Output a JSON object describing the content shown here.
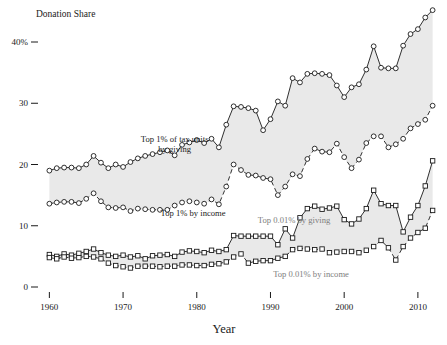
{
  "chart_data": {
    "type": "line",
    "title": "",
    "ylabel": "Donation Share",
    "xlabel": "Year",
    "ylim": [
      0,
      46
    ],
    "xlim": [
      1959,
      2013
    ],
    "ytick_labels": [
      "40%",
      "30",
      "20",
      "10",
      "0"
    ],
    "ytick_values": [
      40,
      30,
      20,
      10,
      0
    ],
    "xtick_labels": [
      "1960",
      "1970",
      "1980",
      "1990",
      "2000",
      "2010"
    ],
    "xtick_values": [
      1960,
      1970,
      1980,
      1990,
      2000,
      2010
    ],
    "grid": false,
    "legend_position": "inline-annotations",
    "annotations": [
      {
        "name": "top1-giving-label",
        "text_line1": "Top 1% of tax units",
        "text_line2": "by giving",
        "x": 1977.0,
        "y": 23.6,
        "faded": false
      },
      {
        "name": "top1-income-label",
        "text": "Top 1% by income",
        "x": 1979.5,
        "y": 11.6,
        "faded": false
      },
      {
        "name": "top001-giving-label",
        "text": "Top 0.01% by giving",
        "x": 1993.2,
        "y": 10.4,
        "faded": true
      },
      {
        "name": "top001-income-label",
        "text": "Top 0.01% by income",
        "x": 1995.5,
        "y": 1.6,
        "faded": true
      }
    ],
    "x": [
      1960,
      1961,
      1962,
      1963,
      1964,
      1965,
      1966,
      1967,
      1968,
      1969,
      1970,
      1971,
      1972,
      1973,
      1974,
      1975,
      1976,
      1977,
      1978,
      1979,
      1980,
      1981,
      1982,
      1983,
      1984,
      1985,
      1986,
      1987,
      1988,
      1989,
      1990,
      1991,
      1992,
      1993,
      1994,
      1995,
      1996,
      1997,
      1998,
      1999,
      2000,
      2001,
      2002,
      2003,
      2004,
      2005,
      2006,
      2007,
      2008,
      2009,
      2010,
      2011,
      2012
    ],
    "series": [
      {
        "name": "Top 1% of tax units by giving",
        "marker": "circle",
        "style": "solid",
        "values": [
          19.0,
          19.4,
          19.5,
          19.5,
          19.4,
          20.0,
          21.4,
          20.3,
          19.4,
          20.0,
          19.6,
          20.4,
          21.0,
          21.4,
          21.7,
          22.0,
          22.3,
          21.5,
          23.2,
          23.6,
          24.0,
          23.5,
          24.2,
          22.8,
          26.5,
          29.5,
          29.4,
          29.2,
          28.8,
          25.6,
          27.4,
          30.3,
          29.6,
          34.1,
          33.4,
          34.8,
          34.9,
          34.8,
          34.6,
          32.9,
          31.0,
          32.6,
          33.1,
          35.5,
          39.3,
          35.8,
          35.7,
          35.7,
          39.4,
          41.3,
          42.1,
          44.0,
          45.2
        ]
      },
      {
        "name": "Top 1% by income",
        "marker": "circle",
        "style": "dashed",
        "values": [
          13.6,
          13.8,
          13.9,
          13.9,
          13.7,
          14.4,
          15.3,
          14.0,
          13.0,
          12.9,
          13.0,
          12.4,
          12.8,
          12.7,
          12.6,
          12.6,
          12.6,
          13.3,
          13.8,
          14.0,
          13.8,
          13.6,
          14.3,
          13.5,
          16.4,
          20.0,
          19.1,
          18.3,
          18.2,
          17.8,
          17.6,
          15.0,
          16.4,
          18.4,
          18.1,
          20.9,
          22.6,
          22.1,
          22.0,
          23.4,
          21.2,
          19.4,
          20.8,
          23.5,
          24.6,
          24.6,
          22.8,
          23.3,
          24.2,
          25.9,
          26.6,
          27.3,
          29.6
        ]
      },
      {
        "name": "Top 0.01% by giving",
        "marker": "square",
        "style": "solid",
        "values": [
          5.3,
          5.0,
          5.4,
          5.2,
          5.5,
          5.8,
          6.2,
          5.6,
          5.2,
          5.0,
          5.2,
          4.9,
          5.1,
          4.6,
          5.1,
          5.2,
          5.3,
          5.0,
          5.7,
          5.9,
          5.8,
          5.6,
          6.0,
          5.8,
          6.1,
          8.4,
          8.3,
          8.3,
          8.3,
          8.3,
          8.3,
          6.9,
          9.5,
          8.0,
          11.3,
          12.8,
          13.2,
          12.7,
          12.9,
          13.2,
          11.0,
          10.3,
          11.1,
          12.8,
          15.8,
          13.6,
          13.3,
          13.3,
          9.0,
          11.4,
          13.3,
          16.5,
          20.6
        ]
      },
      {
        "name": "Top 0.01% by income",
        "marker": "square",
        "style": "dashed",
        "values": [
          4.8,
          4.6,
          4.9,
          4.7,
          4.8,
          5.0,
          4.9,
          4.6,
          3.9,
          3.5,
          3.3,
          3.1,
          3.4,
          3.4,
          3.4,
          3.3,
          3.4,
          3.4,
          3.6,
          3.6,
          3.5,
          3.5,
          3.7,
          3.8,
          4.1,
          4.9,
          5.4,
          3.9,
          4.2,
          4.3,
          4.3,
          4.7,
          5.0,
          6.1,
          6.3,
          6.2,
          6.1,
          6.2,
          5.6,
          5.7,
          5.8,
          5.8,
          5.6,
          6.0,
          6.6,
          7.6,
          6.4,
          4.4,
          6.6,
          8.0,
          8.9,
          9.6,
          12.5
        ]
      }
    ]
  }
}
